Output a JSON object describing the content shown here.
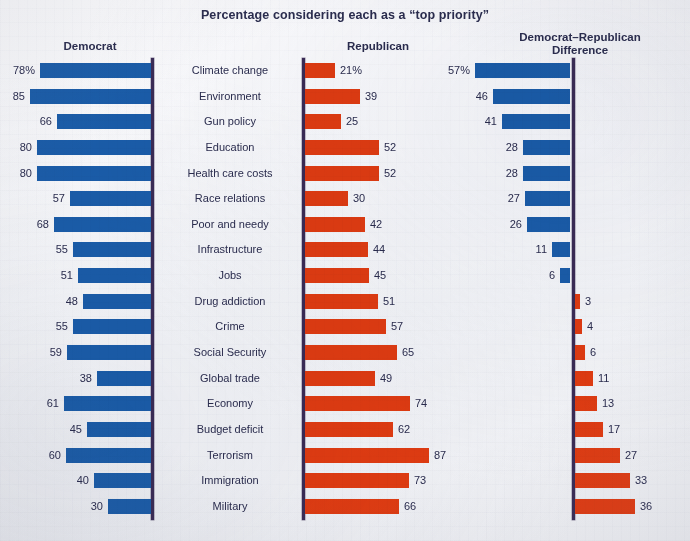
{
  "chart_data": {
    "type": "bar",
    "title": "Percentage considering each as a “top priority”",
    "xlabel": "",
    "ylabel": "",
    "grid": false,
    "legend_position": "none",
    "orientation": "horizontal",
    "columns": [
      {
        "key": "democrat",
        "label": "Democrat",
        "color": "#1a5ca8",
        "direction": "left"
      },
      {
        "key": "republican",
        "label": "Republican",
        "color": "#df3b12",
        "direction": "right"
      },
      {
        "key": "difference",
        "label": "Democrat–Republican Difference",
        "color_positive": "#1a5ca8",
        "color_negative": "#df3b12",
        "direction": "diverging"
      }
    ],
    "header_difference_line1": "Democrat–Republican",
    "header_difference_line2": "Difference",
    "axis_max": 90,
    "difference_axis_max": 60,
    "categories": [
      "Climate change",
      "Environment",
      "Gun policy",
      "Education",
      "Health care costs",
      "Race relations",
      "Poor and needy",
      "Infrastructure",
      "Jobs",
      "Drug addiction",
      "Crime",
      "Social Security",
      "Global trade",
      "Economy",
      "Budget deficit",
      "Terrorism",
      "Immigration",
      "Military"
    ],
    "series": [
      {
        "name": "Democrat",
        "values": [
          78,
          85,
          66,
          80,
          80,
          57,
          68,
          55,
          51,
          48,
          55,
          59,
          38,
          61,
          45,
          60,
          40,
          30
        ]
      },
      {
        "name": "Republican",
        "values": [
          21,
          39,
          25,
          52,
          52,
          30,
          42,
          44,
          45,
          51,
          57,
          65,
          49,
          74,
          62,
          87,
          73,
          66
        ]
      },
      {
        "name": "Democrat–Republican Difference",
        "values": [
          57,
          46,
          41,
          28,
          28,
          27,
          26,
          11,
          6,
          -3,
          -4,
          -6,
          -11,
          -13,
          -17,
          -27,
          -33,
          -36
        ]
      }
    ],
    "value_labels": {
      "democrat": [
        "78%",
        "85",
        "66",
        "80",
        "80",
        "57",
        "68",
        "55",
        "51",
        "48",
        "55",
        "59",
        "38",
        "61",
        "45",
        "60",
        "40",
        "30"
      ],
      "republican": [
        "21%",
        "39",
        "25",
        "52",
        "52",
        "30",
        "42",
        "44",
        "45",
        "51",
        "57",
        "65",
        "49",
        "74",
        "62",
        "87",
        "73",
        "66"
      ],
      "difference": [
        "57%",
        "46",
        "41",
        "28",
        "28",
        "27",
        "26",
        "11",
        "6",
        "3",
        "4",
        "6",
        "11",
        "13",
        "17",
        "27",
        "33",
        "36"
      ]
    }
  }
}
